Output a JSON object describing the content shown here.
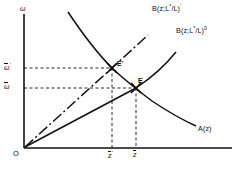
{
  "figure": {
    "type": "economics-equilibrium-diagram",
    "background_color": "#ffffff",
    "line_color": "#111111",
    "axes": {
      "y_axis_label": "ω",
      "x_axis_label": "",
      "origin_label": "O"
    },
    "y_ticks": [
      {
        "id": "omega-prime",
        "label_base": "ω",
        "label_sup": "'",
        "overbar": true,
        "y": 68
      },
      {
        "id": "omega-bar",
        "label_base": "ω",
        "label_sup": "",
        "overbar": true,
        "y": 88
      }
    ],
    "x_ticks": [
      {
        "id": "z-prime",
        "label_base": "z",
        "label_sup": "'",
        "overbar": true,
        "x": 112
      },
      {
        "id": "z-bar",
        "label_base": "z",
        "label_sup": "",
        "overbar": true,
        "x": 136
      }
    ],
    "curves": [
      {
        "id": "b-prime-curve",
        "label_base": "B(z;L",
        "label_star": "*",
        "label_mid": "/L)",
        "label_sup": "'",
        "style": "dash-dot",
        "label_x": 152,
        "label_y": 4
      },
      {
        "id": "b-zero-curve",
        "label_base": "B(z;L",
        "label_star": "*",
        "label_mid": "/L)",
        "label_sup": "0",
        "style": "solid",
        "label_x": 176,
        "label_y": 26
      },
      {
        "id": "a-curve",
        "label_base": "A(z)",
        "label_star": "",
        "label_mid": "",
        "label_sup": "",
        "style": "solid",
        "label_x": 198,
        "label_y": 125
      }
    ],
    "equilibria": [
      {
        "id": "e-prime",
        "label": "E'",
        "x": 112,
        "y": 68,
        "label_x": 117,
        "label_y": 62
      },
      {
        "id": "e",
        "label": "E",
        "x": 136,
        "y": 88,
        "label_x": 138,
        "label_y": 79
      }
    ]
  }
}
